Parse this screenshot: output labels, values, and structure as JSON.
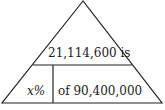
{
  "diagram": {
    "type": "percent-triangle",
    "top_text": "21,114,600 is",
    "bottom_left_text": "x%",
    "bottom_right_text": "of 90,400,000",
    "line_color": "#222222",
    "background": "#ffffff"
  }
}
